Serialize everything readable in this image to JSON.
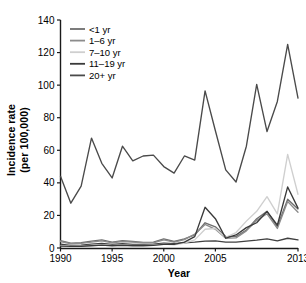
{
  "chart_data": {
    "type": "line",
    "title": "",
    "xlabel": "Year",
    "ylabel": "Incidence rate\n(per 100,000)",
    "ylabel_line1": "Incidence rate",
    "ylabel_line2": "(per 100,000)",
    "xlim": [
      1990,
      2013
    ],
    "ylim": [
      0,
      140
    ],
    "yticks": [
      0,
      20,
      40,
      60,
      80,
      100,
      120,
      140
    ],
    "ytick_labels": [
      "0",
      "20",
      "40",
      "60",
      "80",
      "100",
      "120",
      "140"
    ],
    "xticks": [
      1990,
      1995,
      2000,
      2005,
      2013
    ],
    "xtick_labels": [
      "1990",
      "1995",
      "2000",
      "2005",
      "2013"
    ],
    "grid": false,
    "legend_position": "top-left",
    "x": [
      1990,
      1991,
      1992,
      1993,
      1994,
      1995,
      1996,
      1997,
      1998,
      1999,
      2000,
      2001,
      2002,
      2003,
      2004,
      2005,
      2006,
      2007,
      2008,
      2009,
      2010,
      2011,
      2012,
      2013
    ],
    "series": [
      {
        "name": "<1 yr",
        "color": "#6e6e6e",
        "values": [
          4.5,
          3.0,
          3.2,
          4.2,
          5.0,
          3.6,
          4.5,
          4.0,
          3.5,
          3.6,
          5.6,
          4.0,
          5.6,
          8.0,
          15.5,
          13.0,
          7.0,
          7.0,
          11.0,
          18.0,
          22.5,
          13.0,
          30.0,
          24.0
        ]
      },
      {
        "name": "1–6 yr",
        "color": "#8c8c8c",
        "values": [
          4.0,
          2.6,
          2.8,
          3.6,
          4.4,
          3.2,
          4.0,
          3.6,
          3.2,
          3.2,
          5.0,
          3.6,
          5.2,
          8.5,
          14.5,
          11.5,
          6.0,
          6.2,
          10.5,
          17.0,
          21.0,
          12.0,
          28.5,
          22.0
        ]
      },
      {
        "name": "7–10 yr",
        "color": "#cfcfcf",
        "values": [
          1.5,
          1.2,
          1.3,
          1.6,
          2.0,
          1.6,
          1.8,
          1.6,
          1.6,
          1.8,
          2.4,
          2.0,
          3.0,
          5.0,
          11.5,
          12.0,
          6.5,
          9.5,
          16.5,
          22.5,
          31.5,
          21.0,
          57.5,
          33.0
        ]
      },
      {
        "name": "11–19 yr",
        "color": "#3a3a3a",
        "values": [
          1.2,
          1.0,
          1.1,
          1.4,
          1.8,
          1.4,
          1.6,
          1.4,
          1.4,
          1.6,
          2.2,
          2.2,
          3.6,
          7.0,
          25.0,
          18.0,
          6.0,
          8.0,
          12.5,
          15.5,
          22.5,
          14.0,
          37.5,
          24.5
        ]
      },
      {
        "name": "20+ yr",
        "color": "#4a4a4a",
        "values": [
          44.0,
          27.5,
          38.0,
          67.5,
          52.0,
          43.0,
          62.5,
          53.5,
          56.5,
          57.0,
          50.0,
          46.0,
          56.5,
          54.0,
          96.5,
          72.0,
          48.0,
          40.5,
          62.5,
          100.5,
          71.5,
          90.0,
          125.0,
          92.0
        ]
      }
    ],
    "bottom_series_note": "flat near-zero reference curve",
    "baseline_series": {
      "name": "baseline",
      "color": "#404040",
      "values": [
        2.4,
        1.6,
        1.8,
        2.4,
        2.8,
        2.2,
        2.6,
        2.2,
        2.2,
        2.4,
        3.0,
        2.6,
        3.2,
        3.6,
        4.2,
        4.4,
        3.6,
        3.6,
        4.2,
        4.8,
        5.6,
        4.4,
        6.0,
        5.0
      ]
    }
  },
  "legend": {
    "items": [
      {
        "label": "<1 yr",
        "color": "#6e6e6e"
      },
      {
        "label": "1–6 yr",
        "color": "#8c8c8c"
      },
      {
        "label": "7–10 yr",
        "color": "#cfcfcf"
      },
      {
        "label": "11–19 yr",
        "color": "#3a3a3a"
      },
      {
        "label": "20+ yr",
        "color": "#4a4a4a"
      }
    ]
  },
  "axes": {
    "x_title": "Year",
    "y_title_line1": "Incidence rate",
    "y_title_line2": "(per 100,000)"
  }
}
